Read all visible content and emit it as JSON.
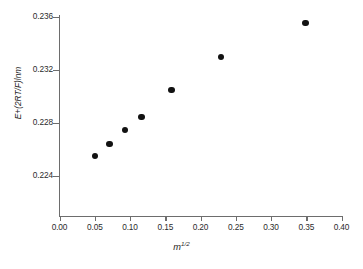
{
  "chart_data": {
    "type": "scatter",
    "title": "",
    "xlabel": "m^1/2",
    "xlabel_base": "m",
    "xlabel_sup": "1/2",
    "ylabel": "E+(2RT/F)lnm",
    "xlim": [
      0.0,
      0.4
    ],
    "ylim": [
      0.2215,
      0.2365
    ],
    "grid": false,
    "legend": null,
    "xticks": [
      "0.00",
      "0.05",
      "0.10",
      "0.15",
      "0.20",
      "0.25",
      "0.30",
      "0.35",
      "0.40"
    ],
    "xtick_values": [
      0.0,
      0.05,
      0.1,
      0.15,
      0.2,
      0.25,
      0.3,
      0.35,
      0.4
    ],
    "yticks": [
      "0.236",
      "0.232",
      "0.228",
      "0.224"
    ],
    "ytick_values": [
      0.236,
      0.232,
      0.228,
      0.224
    ],
    "marker": "filled-circle",
    "marker_color": "#121212",
    "axis_color": "#6d6d6d",
    "x": [
      0.05,
      0.071,
      0.093,
      0.116,
      0.159,
      0.229,
      0.349
    ],
    "y": [
      0.22553,
      0.22643,
      0.22749,
      0.22847,
      0.23051,
      0.233,
      0.23557
    ],
    "points": [
      {
        "x": 0.05,
        "y": 0.22553
      },
      {
        "x": 0.071,
        "y": 0.22643
      },
      {
        "x": 0.093,
        "y": 0.22749
      },
      {
        "x": 0.116,
        "y": 0.22847
      },
      {
        "x": 0.159,
        "y": 0.23051
      },
      {
        "x": 0.229,
        "y": 0.233
      },
      {
        "x": 0.349,
        "y": 0.23557
      }
    ]
  }
}
